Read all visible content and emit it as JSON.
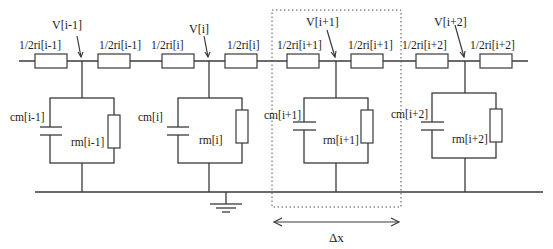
{
  "diagram": {
    "colors": {
      "line": "#3a3a3a",
      "text": "#222222",
      "background": "#ffffff"
    },
    "nodes": [
      {
        "voltage_label": "V[i-1]",
        "left_resistor": "1/2ri[i-1]",
        "right_resistor": "1/2ri[i-1]",
        "capacitor": "cm[i-1]",
        "membrane_resistor": "rm[i-1]"
      },
      {
        "voltage_label": "V[i]",
        "left_resistor": "1/2ri[i]",
        "right_resistor": "1/2ri[i]",
        "capacitor": "cm[i]",
        "membrane_resistor": "rm[i]"
      },
      {
        "voltage_label": "V[i+1]",
        "left_resistor": "1/2ri[i+1]",
        "right_resistor": "1/2ri[i+1]",
        "capacitor": "cm[i+1]",
        "membrane_resistor": "rm[i+1]"
      },
      {
        "voltage_label": "V[i+2]",
        "left_resistor": "1/2ri[i+2]",
        "right_resistor": "1/2ri[i+2]",
        "capacitor": "cm[i+2]",
        "membrane_resistor": "rm[i+2]"
      }
    ],
    "segment_label": "Δx",
    "ground": "ground-symbol"
  }
}
